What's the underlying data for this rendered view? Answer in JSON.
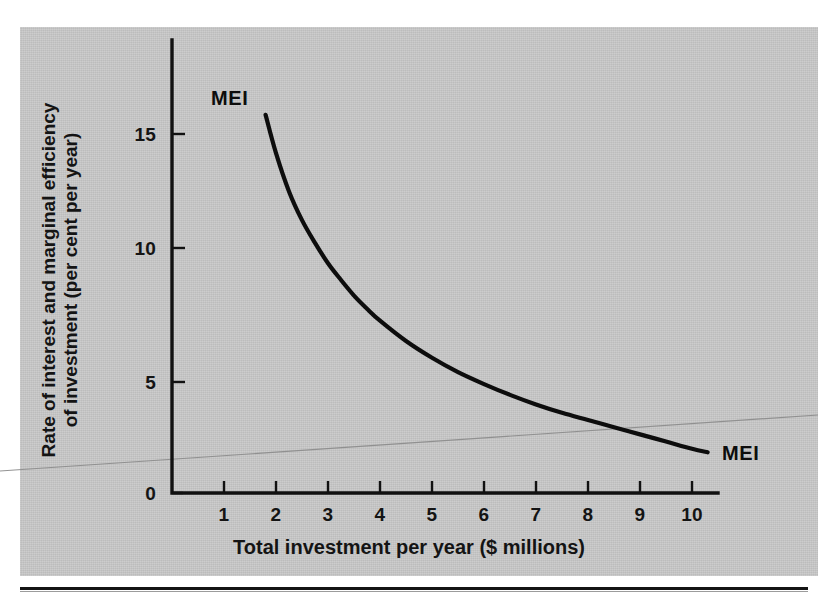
{
  "figure": {
    "background_color": "#ffffff",
    "plate_color": "#c9c9c9",
    "ink_color": "#0d0d0d"
  },
  "chart_data": {
    "type": "line",
    "title": "",
    "subtitle": "",
    "xlabel": "Total investment per year ($ millions)",
    "ylabel": "Rate of interest and marginal efficiency of investment (per cent per year)",
    "ylabel_line1": "Rate of interest and marginal efficiency",
    "ylabel_line2": "of investment (per cent per year)",
    "xlim": [
      0,
      10.5
    ],
    "ylim": [
      0,
      17.5
    ],
    "xticks": [
      1,
      2,
      3,
      4,
      5,
      6,
      7,
      8,
      9,
      10
    ],
    "xticklabels": [
      "1",
      "2",
      "3",
      "4",
      "5",
      "6",
      "7",
      "8",
      "9",
      "10"
    ],
    "yticks": [
      0,
      5,
      10,
      15
    ],
    "yticklabels": [
      "0",
      "5",
      "10",
      "15"
    ],
    "grid": false,
    "legend": "none",
    "annotations": [
      {
        "text": "MEI",
        "x": 1.9,
        "y": 17.0,
        "role": "curve-label-top"
      },
      {
        "text": "MEI",
        "x": 10.6,
        "y": 2.3,
        "role": "curve-label-right"
      }
    ],
    "series": [
      {
        "name": "MEI",
        "label": "MEI",
        "color": "#0d0d0d",
        "linewidth": 4.2,
        "description": "Marginal efficiency of investment schedule, downward sloping convex curve",
        "x": [
          1.8,
          2.0,
          2.25,
          2.5,
          2.75,
          3.0,
          3.25,
          3.5,
          3.75,
          4.0,
          4.5,
          5.0,
          5.5,
          6.0,
          6.5,
          7.0,
          7.5,
          8.0,
          8.5,
          9.0,
          9.5,
          10.0,
          10.3
        ],
        "y": [
          15.8,
          14.2,
          12.6,
          11.4,
          10.45,
          9.6,
          8.9,
          8.25,
          7.7,
          7.2,
          6.35,
          5.65,
          5.05,
          4.55,
          4.1,
          3.7,
          3.35,
          3.05,
          2.75,
          2.45,
          2.15,
          1.85,
          1.7
        ]
      }
    ],
    "artifacts": [
      {
        "name": "scan-fold-line",
        "type": "line",
        "color": "#8d8d8d",
        "from_px": [
          0,
          471
        ],
        "to_px": [
          818,
          415
        ]
      }
    ]
  }
}
